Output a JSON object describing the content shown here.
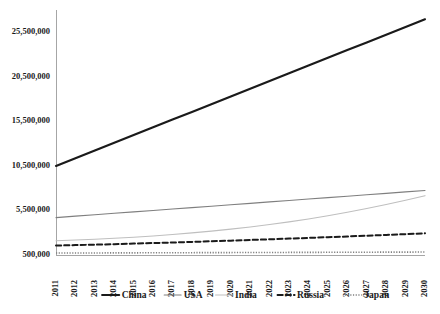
{
  "chart_data": {
    "type": "line",
    "title": "",
    "subtitle": "",
    "xlabel": "",
    "ylabel": "",
    "grid": false,
    "legend_position": "bottom",
    "categories": [
      "2011",
      "2012",
      "2013",
      "2014",
      "2015",
      "2016",
      "2017",
      "2018",
      "2019",
      "2020",
      "2021",
      "2022",
      "2023",
      "2024",
      "2025",
      "2026",
      "2027",
      "2028",
      "2029",
      "2030"
    ],
    "x": [
      2011,
      2012,
      2013,
      2014,
      2015,
      2016,
      2017,
      2018,
      2019,
      2020,
      2021,
      2022,
      2023,
      2024,
      2025,
      2026,
      2027,
      2028,
      2029,
      2030
    ],
    "ylim": [
      500000,
      28000000
    ],
    "yticks": [
      500000,
      5500000,
      10500000,
      15500000,
      20500000,
      25500000
    ],
    "ytick_labels": [
      "500,000",
      "5,500,000",
      "10,500,000",
      "15,500,000",
      "20,500,000",
      "25,500,000"
    ],
    "series": [
      {
        "name": "China",
        "style": "solid",
        "width": 2.2,
        "color": "#1a1a1a",
        "values": [
          10500000,
          11360000,
          12230000,
          13100000,
          13960000,
          14830000,
          15700000,
          16560000,
          17430000,
          18300000,
          19160000,
          20030000,
          20900000,
          21760000,
          22630000,
          23500000,
          24360000,
          25230000,
          26100000,
          26960000
        ]
      },
      {
        "name": "USA",
        "style": "solid",
        "width": 1.1,
        "color": "#7f7f7f",
        "values": [
          4700000,
          4860000,
          5020000,
          5180000,
          5340000,
          5500000,
          5660000,
          5820000,
          5980000,
          6140000,
          6300000,
          6460000,
          6620000,
          6780000,
          6940000,
          7100000,
          7260000,
          7420000,
          7580000,
          7740000
        ]
      },
      {
        "name": "India",
        "style": "solid",
        "width": 1.1,
        "color": "#bfbfbf",
        "values": [
          2100000,
          2180000,
          2270000,
          2380000,
          2500000,
          2640000,
          2800000,
          2980000,
          3180000,
          3400000,
          3650000,
          3920000,
          4220000,
          4550000,
          4910000,
          5300000,
          5720000,
          6170000,
          6650000,
          7160000
        ]
      },
      {
        "name": "Russia",
        "style": "dashed",
        "width": 2.0,
        "color": "#1a1a1a",
        "values": [
          1560000,
          1610000,
          1660000,
          1720000,
          1780000,
          1840000,
          1900000,
          1970000,
          2040000,
          2110000,
          2190000,
          2260000,
          2340000,
          2420000,
          2500000,
          2580000,
          2670000,
          2750000,
          2840000,
          2930000
        ]
      },
      {
        "name": "Japan",
        "style": "dotted",
        "width": 1.6,
        "color": "#808080",
        "values": [
          720000,
          725000,
          730000,
          736000,
          742000,
          748000,
          754000,
          760000,
          766000,
          772000,
          778000,
          784000,
          790000,
          796000,
          802000,
          808000,
          814000,
          820000,
          826000,
          832000
        ]
      }
    ],
    "legend": [
      {
        "label": "China",
        "style": "solid",
        "width": 2.2,
        "color": "#1a1a1a"
      },
      {
        "label": "USA",
        "style": "solid",
        "width": 1.1,
        "color": "#7f7f7f"
      },
      {
        "label": "India",
        "style": "solid",
        "width": 1.1,
        "color": "#bfbfbf"
      },
      {
        "label": "Russia",
        "style": "dashed",
        "width": 2.0,
        "color": "#1a1a1a"
      },
      {
        "label": "Japan",
        "style": "dotted",
        "width": 1.6,
        "color": "#808080"
      }
    ]
  },
  "layout": {
    "plot_left": 56,
    "plot_right": 425,
    "plot_top": 10,
    "plot_bottom": 255,
    "axis_color": "#a6a6a6",
    "legend_y": 295
  }
}
